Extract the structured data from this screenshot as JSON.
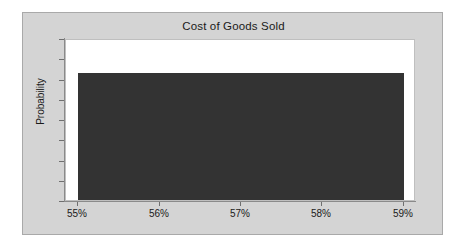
{
  "chart_data": {
    "type": "bar",
    "title": "Cost of Goods Sold",
    "subtitle": "",
    "xlabel": "",
    "ylabel": "Probability",
    "x_tick_labels": [
      "55%",
      "56%",
      "57%",
      "58%",
      "59%"
    ],
    "x_tick_values": [
      55,
      56,
      57,
      58,
      59
    ],
    "xlim": [
      54.85,
      59.15
    ],
    "y_tick_labels": [],
    "ylim": [
      0,
      1.28
    ],
    "grid": false,
    "legend": null,
    "legend_position": "none",
    "bar_color": "#333333",
    "plot_background": "#ffffff",
    "panel_background": "#d4d4d4",
    "annotations": [],
    "note": "Uniform probability distribution: flat density bar spanning 55% to 59%",
    "categories": [
      "55%-59%"
    ],
    "values": [
      1.0
    ],
    "bars": [
      {
        "x_start": 55.0,
        "x_end": 59.0,
        "height": 1.0,
        "label": "Uniform density"
      }
    ]
  },
  "chart": {
    "title": "Cost of Goods Sold",
    "y_axis_label": "Probability"
  }
}
